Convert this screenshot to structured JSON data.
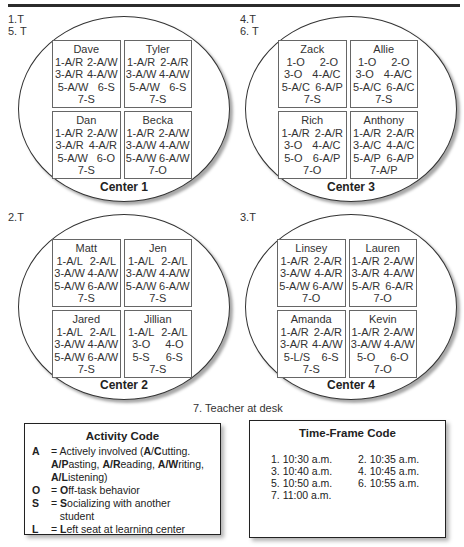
{
  "time_labels": {
    "center1": [
      "1.T",
      "5. T"
    ],
    "center3": [
      "4.T",
      "6. T"
    ],
    "center2": [
      "2.T"
    ],
    "center4": [
      "3.T"
    ]
  },
  "centers": {
    "center1": {
      "title": "Center 1",
      "students": [
        {
          "name": "Dave",
          "rows": [
            [
              "1-A/R",
              "2-A/W"
            ],
            [
              "3-A/R",
              "4-A/W"
            ],
            [
              "5-A/W",
              "6-S"
            ],
            [
              "7-S"
            ]
          ]
        },
        {
          "name": "Tyler",
          "rows": [
            [
              "1-A/R",
              "2-A/R"
            ],
            [
              "3-A/W",
              "4-A/W"
            ],
            [
              "5-A/W",
              "6-S"
            ],
            [
              "7-S"
            ]
          ]
        },
        {
          "name": "Dan",
          "rows": [
            [
              "1-A/R",
              "2-A/W"
            ],
            [
              "3-A/R",
              "4-A/R"
            ],
            [
              "5-A/W",
              "6-O"
            ],
            [
              "7-S"
            ]
          ]
        },
        {
          "name": "Becka",
          "rows": [
            [
              "1-A/R",
              "2-A/W"
            ],
            [
              "3-A/W",
              "4-A/W"
            ],
            [
              "5-A/W",
              "6-A/W"
            ],
            [
              "7-O"
            ]
          ]
        }
      ]
    },
    "center3": {
      "title": "Center 3",
      "students": [
        {
          "name": "Zack",
          "rows": [
            [
              "1-O",
              "2-O"
            ],
            [
              "3-O",
              "4-A/C"
            ],
            [
              "5-A/C",
              "6-A/P"
            ],
            [
              "7-S"
            ]
          ]
        },
        {
          "name": "Allie",
          "rows": [
            [
              "1-O",
              "2-O"
            ],
            [
              "3-O",
              "4-A/C"
            ],
            [
              "5-A/C",
              "6-A/C"
            ],
            [
              "7-S"
            ]
          ]
        },
        {
          "name": "Rich",
          "rows": [
            [
              "1-A/R",
              "2-A/R"
            ],
            [
              "3-O",
              "4-A/C"
            ],
            [
              "5-O",
              "6-A/P"
            ],
            [
              "7-O"
            ]
          ]
        },
        {
          "name": "Anthony",
          "rows": [
            [
              "1-A/R",
              "2-A/R"
            ],
            [
              "3-A/C",
              "4-A/C"
            ],
            [
              "5-A/P",
              "6-A/P"
            ],
            [
              "7-A/P"
            ]
          ]
        }
      ]
    },
    "center2": {
      "title": "Center 2",
      "students": [
        {
          "name": "Matt",
          "rows": [
            [
              "1-A/L",
              "2-A/L"
            ],
            [
              "3-A/W",
              "4-A/W"
            ],
            [
              "5-A/W",
              "6-A/W"
            ],
            [
              "7-S"
            ]
          ]
        },
        {
          "name": "Jen",
          "rows": [
            [
              "1-A/L",
              "2-A/L"
            ],
            [
              "3-A/W",
              "4-A/W"
            ],
            [
              "5-A/W",
              "6-A/W"
            ],
            [
              "7-S"
            ]
          ]
        },
        {
          "name": "Jared",
          "rows": [
            [
              "1-A/L",
              "2-A/L"
            ],
            [
              "3-A/W",
              "4-A/W"
            ],
            [
              "5-A/W",
              "6-A/W"
            ],
            [
              "7-S"
            ]
          ]
        },
        {
          "name": "Jillian",
          "rows": [
            [
              "1-A/L",
              "2-A/L"
            ],
            [
              "3-O",
              "4-O"
            ],
            [
              "5-S",
              "6-S"
            ],
            [
              "7-S"
            ]
          ]
        }
      ]
    },
    "center4": {
      "title": "Center 4",
      "students": [
        {
          "name": "Linsey",
          "rows": [
            [
              "1-A/R",
              "2-A/R"
            ],
            [
              "3-A/W",
              "4-A/R"
            ],
            [
              "5-A/W",
              "6-A/W"
            ],
            [
              "7-O"
            ]
          ]
        },
        {
          "name": "Lauren",
          "rows": [
            [
              "1-A/R",
              "2-A/W"
            ],
            [
              "3-A/R",
              "4-A/W"
            ],
            [
              "5-A/R",
              "6-A/R"
            ],
            [
              "7-O"
            ]
          ]
        },
        {
          "name": "Amanda",
          "rows": [
            [
              "1-A/R",
              "2-A/R"
            ],
            [
              "3-A/R",
              "4-A/W"
            ],
            [
              "5-L/S",
              "6-S"
            ],
            [
              "7-S"
            ]
          ]
        },
        {
          "name": "Kevin",
          "rows": [
            [
              "1-A/R",
              "2-A/W"
            ],
            [
              "3-A/W",
              "4-A/W"
            ],
            [
              "5-O",
              "6-O"
            ],
            [
              "7-O"
            ]
          ]
        }
      ]
    }
  },
  "teacher_label": "7. Teacher at desk",
  "activity_code": {
    "title": "Activity Code",
    "items": [
      {
        "key": "A",
        "desc_html": "= Actively involved (<b>A</b>/<b>C</b>utting. <b>A/P</b>asting, <b>A/R</b>eading, <b>A/W</b>riting, <b>A/L</b>istening)"
      },
      {
        "key": "O",
        "desc_html": "= <b>O</b>ff-task behavior"
      },
      {
        "key": "S",
        "desc_html": "= <b>S</b>ocializing with another<br>&nbsp;&nbsp;&nbsp;student"
      },
      {
        "key": "L",
        "desc_html": "= <b>L</b>eft seat at learning center"
      }
    ]
  },
  "time_frame_code": {
    "title": "Time-Frame Code",
    "times": [
      "1. 10:30 a.m.",
      "2. 10:35 a.m.",
      "3. 10:40 a.m.",
      "4. 10:45 a.m.",
      "5. 10:50 a.m.",
      "6. 10:55 a.m.",
      "7. 11:00 a.m."
    ]
  }
}
